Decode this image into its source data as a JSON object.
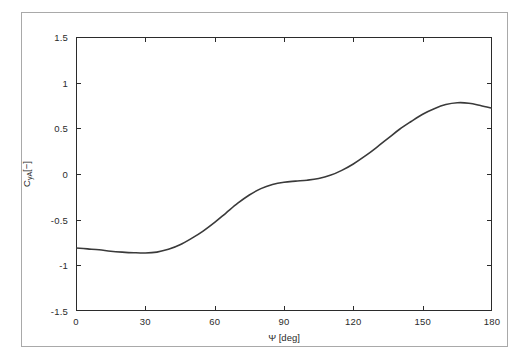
{
  "chart_data": {
    "type": "line",
    "title": "",
    "xlabel": "Ψ [deg]",
    "ylabel_main": "C",
    "ylabel_sub": "yA",
    "ylabel_unit": "[−]",
    "ylabel": "CyA[−]",
    "xlim": [
      0,
      180
    ],
    "ylim": [
      -1.5,
      1.5
    ],
    "xticks": [
      0,
      30,
      60,
      90,
      120,
      150,
      180
    ],
    "xticklabels": [
      "0",
      "30",
      "60",
      "90",
      "120",
      "150",
      "180"
    ],
    "yticks": [
      1.5,
      1,
      0.5,
      0,
      -0.5,
      -1,
      -1.5
    ],
    "yticklabels": [
      "1.5",
      "1",
      "0.5",
      "0",
      "-0.5",
      "-1",
      "-1.5"
    ],
    "grid": false,
    "legend": null,
    "series": [
      {
        "name": "CyA",
        "color": "#3a3a3a",
        "linewidth": 1.6,
        "x": [
          0,
          5,
          10,
          15,
          20,
          25,
          30,
          35,
          40,
          45,
          50,
          55,
          60,
          65,
          70,
          75,
          80,
          85,
          90,
          95,
          100,
          105,
          110,
          115,
          120,
          125,
          130,
          135,
          140,
          145,
          150,
          155,
          160,
          165,
          170,
          175,
          180
        ],
        "y": [
          -0.81,
          -0.82,
          -0.83,
          -0.845,
          -0.855,
          -0.862,
          -0.865,
          -0.855,
          -0.825,
          -0.775,
          -0.705,
          -0.625,
          -0.53,
          -0.425,
          -0.32,
          -0.23,
          -0.16,
          -0.115,
          -0.09,
          -0.078,
          -0.068,
          -0.05,
          -0.015,
          0.04,
          0.11,
          0.195,
          0.29,
          0.39,
          0.49,
          0.575,
          0.655,
          0.715,
          0.76,
          0.78,
          0.775,
          0.75,
          0.72
        ]
      }
    ]
  },
  "axes": {
    "frame_color": "#2b2b2b",
    "outer_border_color": "#a9a9a9"
  }
}
